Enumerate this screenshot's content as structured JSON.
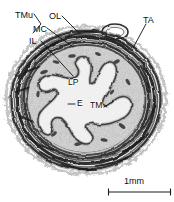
{
  "figure": {
    "type": "histology-micrograph",
    "background_color": "#ffffff",
    "width": 174,
    "height": 202
  },
  "labels": [
    {
      "id": "tmu",
      "text": "TMu",
      "x": 15,
      "y": 11,
      "kind": "outer",
      "full_name": "tunica muscularis"
    },
    {
      "id": "ol",
      "text": "OL",
      "x": 49,
      "y": 12,
      "kind": "outer",
      "full_name": "outer layer"
    },
    {
      "id": "mc",
      "text": "MC",
      "x": 33,
      "y": 25,
      "kind": "outer",
      "full_name": "middle circular layer"
    },
    {
      "id": "il",
      "text": "IL",
      "x": 29,
      "y": 37,
      "kind": "outer",
      "full_name": "inner longitudinal layer"
    },
    {
      "id": "ta",
      "text": "TA",
      "x": 143,
      "y": 16,
      "kind": "outer",
      "full_name": "tunica adventitia"
    },
    {
      "id": "lp",
      "text": "LP",
      "x": 68,
      "y": 78,
      "kind": "inner",
      "full_name": "lamina propria"
    },
    {
      "id": "e",
      "text": "E",
      "x": 77,
      "y": 104,
      "kind": "inner",
      "full_name": "epithelium"
    },
    {
      "id": "tm",
      "text": "TM",
      "x": 90,
      "y": 106,
      "kind": "inner",
      "full_name": "tunica mucosa"
    }
  ],
  "scale_bar": {
    "text": "1mm",
    "text_x": 124,
    "text_y": 178,
    "bar_x1": 108,
    "bar_x2": 171,
    "bar_y": 192,
    "cap_height": 7,
    "color": "#1a1a1a"
  },
  "colors": {
    "ink": "#111111",
    "tissue_dark": "#2b2b2b",
    "tissue_mid": "#7b7b7b",
    "tissue_light": "#cfcfcf",
    "background": "#ffffff"
  }
}
